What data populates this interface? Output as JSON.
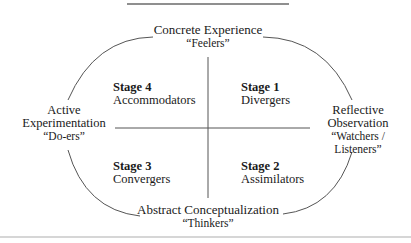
{
  "diagram": {
    "type": "learning-styles-cycle",
    "colors": {
      "line": "#555555",
      "text": "#1a1a1a",
      "background": "#ffffff"
    },
    "poles": {
      "top": {
        "label": "Concrete Experience",
        "nickname": "“Feelers”"
      },
      "right": {
        "label_line1": "Reflective",
        "label_line2": "Observation",
        "nickname_line1": "“Watchers /",
        "nickname_line2": "Listeners”"
      },
      "bottom": {
        "label": "Abstract Conceptualization",
        "nickname": "“Thinkers”"
      },
      "left": {
        "label_line1": "Active",
        "label_line2": "Experimentation",
        "nickname": "“Do-ers”"
      }
    },
    "quadrants": [
      {
        "position": "top-right",
        "stage": "Stage 1",
        "name": "Divergers"
      },
      {
        "position": "bottom-right",
        "stage": "Stage 2",
        "name": "Assimilators"
      },
      {
        "position": "bottom-left",
        "stage": "Stage 3",
        "name": "Convergers"
      },
      {
        "position": "top-left",
        "stage": "Stage 4",
        "name": "Accommodators"
      }
    ]
  }
}
